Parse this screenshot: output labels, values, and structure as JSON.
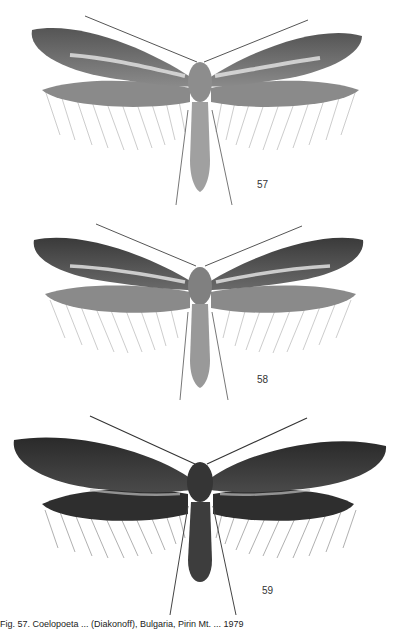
{
  "plate": {
    "figures": [
      {
        "number": "57",
        "label": "moth-illustration-57",
        "tone": "light",
        "wing_color": "#7a7a7a",
        "body_color": "#9a9a9a",
        "streak_color": "#e6e6e6"
      },
      {
        "number": "58",
        "label": "moth-illustration-58",
        "tone": "medium",
        "wing_color": "#5e5e5e",
        "body_color": "#8c8c8c",
        "streak_color": "#e0e0e0"
      },
      {
        "number": "59",
        "label": "moth-illustration-59",
        "tone": "dark",
        "wing_color": "#333333",
        "body_color": "#3d3d3d",
        "streak_color": "#bdbdbd"
      }
    ],
    "caption": "Fig. 57. Coelopoeta ... (Diakonoff), Bulgaria, Pirin Mt. ... 1979"
  }
}
